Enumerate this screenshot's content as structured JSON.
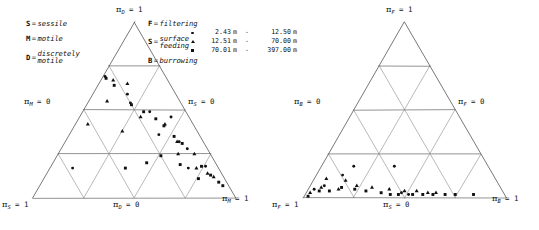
{
  "figure": {
    "background_color": "#ffffff",
    "ink_color": "#111111",
    "grid_color": "#8a8a8a"
  },
  "depth_legend": {
    "name": "depth-range-legend",
    "unit": "m",
    "dash": "-",
    "entries": [
      {
        "marker": "circle",
        "low": "2.43",
        "high": "12.50",
        "unit_low": "m",
        "unit_high": "m",
        "label": "2.43 m - 12.50 m"
      },
      {
        "marker": "triangle",
        "low": "12.51",
        "high": "70.00",
        "unit_low": "m",
        "unit_high": "m",
        "label": "12.51 m - 70.00 m"
      },
      {
        "marker": "square",
        "low": "70.01",
        "high": "397.00",
        "unit_low": "m",
        "unit_high": "m",
        "label": "70.01 m - 397.00 m"
      }
    ]
  },
  "motility_key": {
    "name": "motility-key",
    "items": [
      {
        "symbol": "S",
        "eq": "=",
        "definition": "sessile",
        "line2": ""
      },
      {
        "symbol": "M",
        "eq": "=",
        "definition": "motile",
        "line2": ""
      },
      {
        "symbol": "D",
        "eq": "=",
        "definition": "discretely",
        "line2": "motile"
      }
    ]
  },
  "feeding_key": {
    "name": "feeding-key",
    "items": [
      {
        "symbol": "F",
        "eq": "=",
        "definition": "filtering",
        "line2": ""
      },
      {
        "symbol": "S",
        "eq": "=",
        "definition": "surface",
        "line2": "feeding"
      },
      {
        "symbol": "B",
        "eq": "=",
        "definition": "burrowing",
        "line2": ""
      }
    ]
  },
  "left_panel": {
    "name": "motility-ternary-panel",
    "labels": {
      "apex": {
        "pi": "π",
        "sub": "D",
        "value": "= 1"
      },
      "bottom_left": {
        "pi": "π",
        "sub": "S",
        "value": "= 1"
      },
      "bottom_right": {
        "pi": "π",
        "sub": "M",
        "value": "= 1"
      },
      "bottom_mid": {
        "pi": "π",
        "sub": "D",
        "value": "= 0"
      },
      "left_edge": {
        "pi": "π",
        "sub": "M",
        "value": "= 0"
      },
      "right_edge": {
        "pi": "π",
        "sub": "S",
        "value": "= 0"
      }
    }
  },
  "right_panel": {
    "name": "feeding-ternary-panel",
    "labels": {
      "apex": {
        "pi": "π",
        "sub": "F",
        "value": "= 1"
      },
      "bottom_left": {
        "pi": "π",
        "sub": "F",
        "value": "= 1"
      },
      "bottom_right": {
        "pi": "π",
        "sub": "B",
        "value": "= 1"
      },
      "bottom_mid": {
        "pi": "π",
        "sub": "S",
        "value": "= 0"
      },
      "left_edge": {
        "pi": "π",
        "sub": "B",
        "value": "= 0"
      },
      "right_edge": {
        "pi": "π",
        "sub": "F",
        "value": "= 0"
      }
    }
  },
  "chart_data": [
    {
      "type": "scatter",
      "name": "motility-ternary",
      "projection": "ternary",
      "title": "",
      "subdivisions": 4,
      "grid": true,
      "axes": {
        "apex": {
          "label": "π_D = 1",
          "component": "D",
          "meaning": "discretely motile"
        },
        "bottom_left": {
          "label": "π_S = 1",
          "component": "S",
          "meaning": "sessile"
        },
        "bottom_right": {
          "label": "π_M = 1",
          "component": "M",
          "meaning": "motile"
        },
        "bottom_edge": {
          "label": "π_D = 0"
        },
        "left_edge": {
          "label": "π_M = 0"
        },
        "right_edge": {
          "label": "π_S = 0"
        }
      },
      "series": [
        {
          "name": "2.43 m - 12.50 m",
          "marker": "circle",
          "points": [
            {
              "S": 0.3,
              "M": 0.01,
              "D": 0.69
            },
            {
              "S": 0.24,
              "M": 0.17,
              "D": 0.59
            },
            {
              "S": 0.25,
              "M": 0.21,
              "D": 0.54
            },
            {
              "S": 0.18,
              "M": 0.33,
              "D": 0.49
            },
            {
              "S": 0.09,
              "M": 0.45,
              "D": 0.46
            },
            {
              "S": 0.2,
              "M": 0.44,
              "D": 0.36
            },
            {
              "S": 0.12,
              "M": 0.56,
              "D": 0.32
            },
            {
              "S": 0.1,
              "M": 0.62,
              "D": 0.28
            },
            {
              "S": 0.15,
              "M": 0.68,
              "D": 0.17
            },
            {
              "S": 0.06,
              "M": 0.76,
              "D": 0.18
            },
            {
              "S": 0.72,
              "M": 0.11,
              "D": 0.17
            }
          ]
        },
        {
          "name": "12.51 m - 70.00 m",
          "marker": "triangle",
          "points": [
            {
              "S": 0.27,
              "M": 0.06,
              "D": 0.67
            },
            {
              "S": 0.21,
              "M": 0.14,
              "D": 0.65
            },
            {
              "S": 0.36,
              "M": 0.09,
              "D": 0.55
            },
            {
              "S": 0.52,
              "M": 0.06,
              "D": 0.42
            },
            {
              "S": 0.24,
              "M": 0.3,
              "D": 0.46
            },
            {
              "S": 0.14,
              "M": 0.44,
              "D": 0.42
            },
            {
              "S": 0.37,
              "M": 0.25,
              "D": 0.38
            },
            {
              "S": 0.13,
              "M": 0.55,
              "D": 0.32
            },
            {
              "S": 0.16,
              "M": 0.59,
              "D": 0.25
            },
            {
              "S": 0.08,
              "M": 0.67,
              "D": 0.25
            },
            {
              "S": 0.11,
              "M": 0.72,
              "D": 0.17
            },
            {
              "S": 0.07,
              "M": 0.79,
              "D": 0.14
            },
            {
              "S": 0.05,
              "M": 0.83,
              "D": 0.12
            }
          ]
        },
        {
          "name": "70.01 m - 397.00 m",
          "marker": "square",
          "points": [
            {
              "S": 0.3,
              "M": 0.02,
              "D": 0.68
            },
            {
              "S": 0.28,
              "M": 0.08,
              "D": 0.64
            },
            {
              "S": 0.25,
              "M": 0.22,
              "D": 0.53
            },
            {
              "S": 0.21,
              "M": 0.3,
              "D": 0.49
            },
            {
              "S": 0.17,
              "M": 0.38,
              "D": 0.45
            },
            {
              "S": 0.15,
              "M": 0.44,
              "D": 0.41
            },
            {
              "S": 0.13,
              "M": 0.52,
              "D": 0.35
            },
            {
              "S": 0.11,
              "M": 0.58,
              "D": 0.31
            },
            {
              "S": 0.25,
              "M": 0.51,
              "D": 0.24
            },
            {
              "S": 0.34,
              "M": 0.46,
              "D": 0.2
            },
            {
              "S": 0.18,
              "M": 0.63,
              "D": 0.19
            },
            {
              "S": 0.08,
              "M": 0.74,
              "D": 0.18
            },
            {
              "S": 0.46,
              "M": 0.37,
              "D": 0.17
            },
            {
              "S": 0.06,
              "M": 0.81,
              "D": 0.13
            },
            {
              "S": 0.13,
              "M": 0.76,
              "D": 0.11
            },
            {
              "S": 0.04,
              "M": 0.87,
              "D": 0.09
            },
            {
              "S": 0.03,
              "M": 0.9,
              "D": 0.07
            }
          ]
        }
      ]
    },
    {
      "type": "scatter",
      "name": "feeding-ternary",
      "projection": "ternary",
      "title": "",
      "subdivisions": 4,
      "grid": true,
      "axes": {
        "apex": {
          "label": "π_F = 1",
          "component": "F",
          "meaning": "filtering"
        },
        "bottom_left": {
          "label": "π_F = 1",
          "component": "F",
          "meaning": "filtering"
        },
        "bottom_right": {
          "label": "π_B = 1",
          "component": "B",
          "meaning": "burrowing"
        },
        "bottom_edge": {
          "label": "π_S = 0"
        },
        "left_edge": {
          "label": "π_B = 0"
        },
        "right_edge": {
          "label": "π_F = 0"
        }
      },
      "series": [
        {
          "name": "2.43 m - 12.50 m",
          "marker": "circle",
          "points": [
            {
              "F": 0.92,
              "S": 0.05,
              "B": 0.03
            },
            {
              "F": 0.86,
              "S": 0.07,
              "B": 0.07
            },
            {
              "F": 0.74,
              "S": 0.13,
              "B": 0.13
            },
            {
              "F": 0.66,
              "S": 0.18,
              "B": 0.16
            },
            {
              "F": 0.46,
              "S": 0.18,
              "B": 0.36
            },
            {
              "F": 0.5,
              "S": 0.03,
              "B": 0.47
            },
            {
              "F": 0.47,
              "S": 0.02,
              "B": 0.51
            }
          ]
        },
        {
          "name": "12.51 m - 70.00 m",
          "marker": "triangle",
          "points": [
            {
              "F": 0.95,
              "S": 0.03,
              "B": 0.02
            },
            {
              "F": 0.88,
              "S": 0.06,
              "B": 0.06
            },
            {
              "F": 0.83,
              "S": 0.11,
              "B": 0.06
            },
            {
              "F": 0.8,
              "S": 0.05,
              "B": 0.15
            },
            {
              "F": 0.74,
              "S": 0.1,
              "B": 0.16
            },
            {
              "F": 0.7,
              "S": 0.07,
              "B": 0.23
            },
            {
              "F": 0.63,
              "S": 0.06,
              "B": 0.31
            },
            {
              "F": 0.55,
              "S": 0.05,
              "B": 0.4
            },
            {
              "F": 0.48,
              "S": 0.04,
              "B": 0.48
            },
            {
              "F": 0.42,
              "S": 0.04,
              "B": 0.54
            },
            {
              "F": 0.37,
              "S": 0.03,
              "B": 0.6
            },
            {
              "F": 0.33,
              "S": 0.03,
              "B": 0.64
            }
          ]
        },
        {
          "name": "70.01 m - 397.00 m",
          "marker": "square",
          "points": [
            {
              "F": 0.97,
              "S": 0.01,
              "B": 0.02
            },
            {
              "F": 0.9,
              "S": 0.04,
              "B": 0.06
            },
            {
              "F": 0.85,
              "S": 0.04,
              "B": 0.11
            },
            {
              "F": 0.78,
              "S": 0.06,
              "B": 0.16
            },
            {
              "F": 0.72,
              "S": 0.05,
              "B": 0.23
            },
            {
              "F": 0.67,
              "S": 0.04,
              "B": 0.29
            },
            {
              "F": 0.6,
              "S": 0.03,
              "B": 0.37
            },
            {
              "F": 0.56,
              "S": 0.02,
              "B": 0.42
            },
            {
              "F": 0.52,
              "S": 0.02,
              "B": 0.46
            },
            {
              "F": 0.45,
              "S": 0.02,
              "B": 0.53
            },
            {
              "F": 0.4,
              "S": 0.02,
              "B": 0.58
            },
            {
              "F": 0.35,
              "S": 0.02,
              "B": 0.63
            },
            {
              "F": 0.29,
              "S": 0.02,
              "B": 0.69
            },
            {
              "F": 0.24,
              "S": 0.02,
              "B": 0.74
            },
            {
              "F": 0.15,
              "S": 0.02,
              "B": 0.83
            }
          ]
        }
      ]
    }
  ]
}
